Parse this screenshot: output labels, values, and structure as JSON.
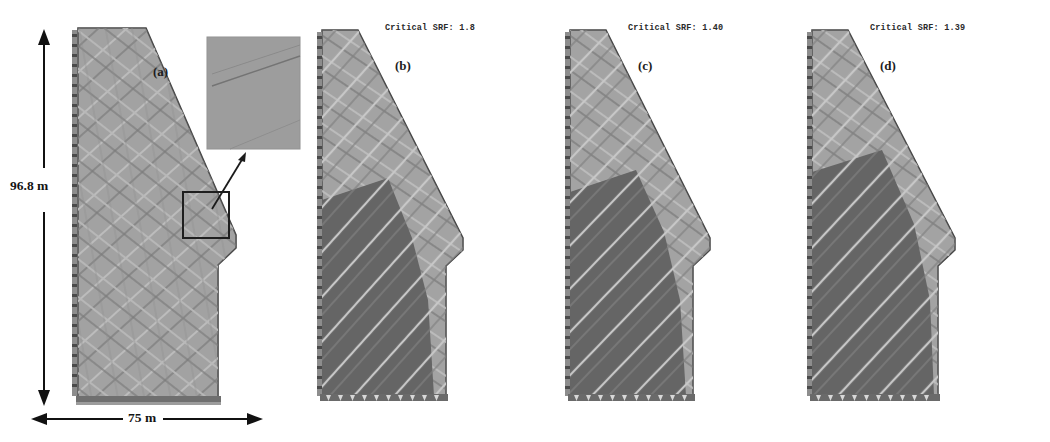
{
  "figure": {
    "type": "multi-panel-slope-stability-figure",
    "panel_count": 4,
    "background_color": "#ffffff"
  },
  "dimensions": {
    "height_label": "96.8 m",
    "width_label": "75 m",
    "height_value": 96.8,
    "width_value": 75,
    "unit": "m"
  },
  "panels": [
    {
      "id": "a",
      "letter": "(a)",
      "srf_text": "",
      "has_srf": false,
      "has_inset": true,
      "has_dimensions": true,
      "description": "jointed rock slope model geometry"
    },
    {
      "id": "b",
      "letter": "(b)",
      "srf_text": "Critical SRF: 1.8",
      "srf_value": 1.8,
      "has_srf": true,
      "has_inset": false,
      "has_dimensions": false,
      "description": "failure zone shear strength reduction result"
    },
    {
      "id": "c",
      "letter": "(c)",
      "srf_text": "Critical SRF: 1.40",
      "srf_value": 1.4,
      "has_srf": true,
      "has_inset": false,
      "has_dimensions": false,
      "description": "failure zone shear strength reduction result"
    },
    {
      "id": "d",
      "letter": "(d)",
      "srf_text": "Critical SRF: 1.39",
      "srf_value": 1.39,
      "has_srf": true,
      "has_inset": false,
      "has_dimensions": false,
      "description": "failure zone shear strength reduction result"
    }
  ],
  "inset": {
    "caption": "",
    "detail_name": "joint-mesh-detail",
    "fill_color": "#9a9a9a"
  },
  "colors": {
    "rock_mass_light": "#a3a3a3",
    "rock_mass_mid": "#8e8e8e",
    "failure_zone_dark": "#5a5a5a",
    "joint_trace_light": "#c9c9c9",
    "joint_trace_dark": "#6d6d6d",
    "outline": "#3a3a3a",
    "boundary_marker": "#4a4a4a",
    "arrow": "#111111",
    "text": "#1d1d1d"
  },
  "icons": {
    "vertical_dimension_arrow": "double-headed-vertical-arrow",
    "horizontal_dimension_arrow": "double-headed-horizontal-arrow",
    "inset_pointer": "callout-arrow",
    "roller_support": "roller-boundary-marker",
    "fixed_support": "fixed-boundary-marker"
  }
}
